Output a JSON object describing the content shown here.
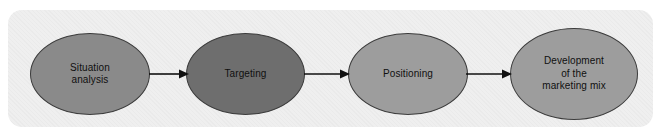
{
  "diagram": {
    "panel_color": "#efefef",
    "outline_color": "#3c3c3c",
    "arrow_color": "#111111",
    "text_color": "#101010",
    "stages": [
      {
        "id": "situation-analysis",
        "label": "Situation\nanalysis",
        "fill": "#8a8a8a"
      },
      {
        "id": "targeting",
        "label": "Targeting",
        "fill": "#6e6e6e"
      },
      {
        "id": "positioning",
        "label": "Positioning",
        "fill": "#9d9d9d"
      },
      {
        "id": "development-of-the-marketing-mix",
        "label": "Development\nof the\nmarketing mix",
        "fill": "#9d9d9d"
      }
    ],
    "connectors": [
      {
        "id": "arrow-situation-to-targeting",
        "from": "situation-analysis",
        "to": "targeting"
      },
      {
        "id": "arrow-targeting-to-positioning",
        "from": "targeting",
        "to": "positioning"
      },
      {
        "id": "arrow-positioning-to-development",
        "from": "positioning",
        "to": "development-of-the-marketing-mix"
      }
    ]
  }
}
